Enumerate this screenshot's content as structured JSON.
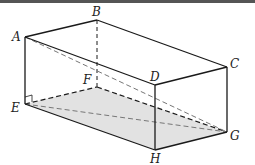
{
  "diagram": {
    "type": "cuboid",
    "vertices": {
      "A": {
        "label": "A",
        "x": 25,
        "y": 37
      },
      "B": {
        "label": "B",
        "x": 97,
        "y": 20
      },
      "C": {
        "label": "C",
        "x": 227,
        "y": 67
      },
      "D": {
        "label": "D",
        "x": 155,
        "y": 85
      },
      "E": {
        "label": "E",
        "x": 25,
        "y": 104
      },
      "F": {
        "label": "F",
        "x": 97,
        "y": 87
      },
      "G": {
        "label": "G",
        "x": 227,
        "y": 132
      },
      "H": {
        "label": "H",
        "x": 155,
        "y": 150
      }
    },
    "solid_edges": [
      "AB",
      "BC",
      "CD",
      "DA",
      "AE",
      "DH",
      "CG",
      "EH",
      "HG"
    ],
    "hidden_edges": [
      "BF",
      "EF",
      "FG"
    ],
    "diagonals": [
      "AG",
      "EG"
    ],
    "shaded_face": "EFGH",
    "right_angle_at": "E",
    "colors": {
      "edge": "#1a1a1a",
      "diagonal": "#777777",
      "shade": "#e2e2e2",
      "top_bar": "#555555"
    }
  }
}
